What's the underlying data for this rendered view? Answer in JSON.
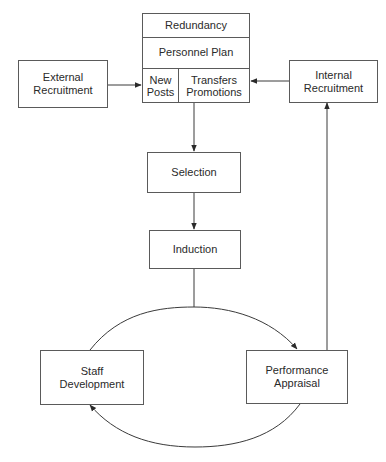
{
  "diagram": {
    "type": "flowchart",
    "colors": {
      "line": "#3a3a3a",
      "border": "#5a5a5a",
      "text": "#2a2a2a",
      "background": "#ffffff"
    },
    "personnel_block": {
      "redundancy": "Redundancy",
      "personnel_plan": "Personnel Plan",
      "new_posts": "New\nPosts",
      "transfers_promotions": "Transfers\nPromotions"
    },
    "nodes": {
      "external_recruitment": "External\nRecruitment",
      "internal_recruitment": "Internal\nRecruitment",
      "selection": "Selection",
      "induction": "Induction",
      "staff_development": "Staff\nDevelopment",
      "performance_appraisal": "Performance\nAppraisal"
    },
    "edges": [
      {
        "from": "External Recruitment",
        "to": "New Posts"
      },
      {
        "from": "Internal Recruitment",
        "to": "Transfers Promotions"
      },
      {
        "from": "Personnel Plan",
        "to": "Selection"
      },
      {
        "from": "Selection",
        "to": "Induction"
      },
      {
        "from": "Induction",
        "to": "Performance Appraisal"
      },
      {
        "from": "Staff Development",
        "to": "Performance Appraisal"
      },
      {
        "from": "Performance Appraisal",
        "to": "Staff Development"
      },
      {
        "from": "Performance Appraisal",
        "to": "Internal Recruitment"
      }
    ]
  }
}
